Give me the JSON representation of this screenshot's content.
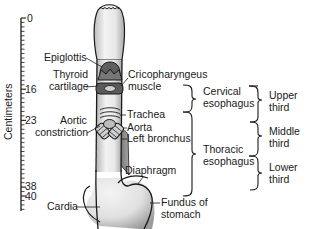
{
  "figure": {
    "type": "anatomical-diagram",
    "subject": "esophagus"
  },
  "ruler": {
    "title": "Centimeters",
    "ticks": [
      {
        "value": "0",
        "cm": 0
      },
      {
        "value": "16",
        "cm": 16
      },
      {
        "value": "23",
        "cm": 23
      },
      {
        "value": "38",
        "cm": 38
      },
      {
        "value": "40",
        "cm": 40
      }
    ],
    "range_cm": [
      0,
      43
    ]
  },
  "labels_left": {
    "epiglottis": "Epiglottis",
    "thyroid_line1": "Thyroid",
    "thyroid_line2": "cartilage",
    "aortic_line1": "Aortic",
    "aortic_line2": "constriction",
    "cardia": "Cardia"
  },
  "labels_right": {
    "crico_line1": "Cricopharyngeus",
    "crico_line2": "muscle",
    "trachea": "Trachea",
    "aorta": "Aorta",
    "left_bronchus": "Left bronchus",
    "diaphragm": "Diaphragm",
    "fundus_line1": "Fundus of",
    "fundus_line2": "stomach"
  },
  "regions": {
    "cervical_line1": "Cervical",
    "cervical_line2": "esophagus",
    "thoracic_line1": "Thoracic",
    "thoracic_line2": "esophagus"
  },
  "thirds": {
    "upper_line1": "Upper",
    "upper_line2": "third",
    "middle_line1": "Middle",
    "middle_line2": "third",
    "lower_line1": "Lower",
    "lower_line2": "third"
  },
  "colors": {
    "outline": "#1a1a1a",
    "tube_fill": "#e6e6e6",
    "shade": "#9a9a9a",
    "aorta_fill": "#8c8c8c",
    "background": "#ffffff"
  }
}
